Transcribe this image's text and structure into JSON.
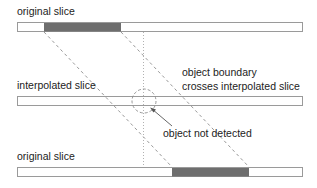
{
  "labels": {
    "top_slice": "original slice",
    "middle_slice": "interpolated slice",
    "bottom_slice": "original slice",
    "boundary_line1": "object boundary",
    "boundary_line2": "crosses interpolated slice",
    "not_detected": "object not detected"
  },
  "colors": {
    "slice_fill": "#ffffff",
    "slice_border": "#9a9a9a",
    "object_fill": "#6e6e6e",
    "dashed_line": "#8c8c8c",
    "dotted_line": "#a8a8a8",
    "text": "#222222"
  },
  "slices": [
    {
      "name": "top",
      "x": 17,
      "y": 22,
      "w": 285,
      "h": 10,
      "object_x": 44,
      "object_w": 77
    },
    {
      "name": "middle",
      "x": 17,
      "y": 96,
      "w": 285,
      "h": 10
    },
    {
      "name": "bottom",
      "x": 17,
      "y": 167,
      "w": 285,
      "h": 10,
      "object_x": 172,
      "object_w": 77
    }
  ]
}
